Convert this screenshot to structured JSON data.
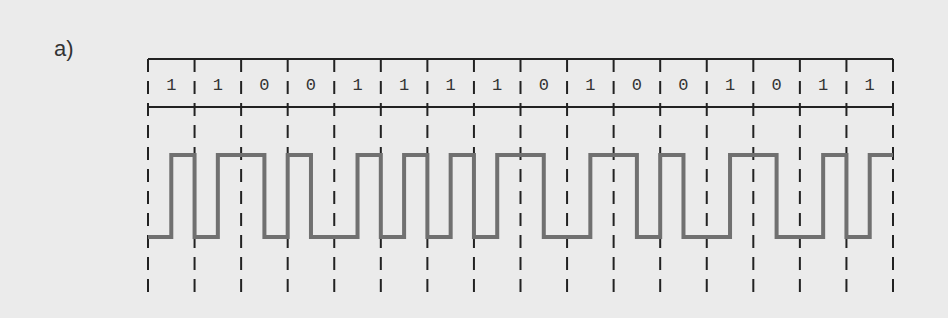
{
  "figure_label": "a)",
  "encoding": "Manchester",
  "bits": [
    1,
    1,
    0,
    0,
    1,
    1,
    1,
    1,
    0,
    1,
    0,
    0,
    1,
    0,
    1,
    1
  ],
  "colors": {
    "grid": "#222222",
    "signal": "#707070",
    "background": "#ebebeb"
  }
}
